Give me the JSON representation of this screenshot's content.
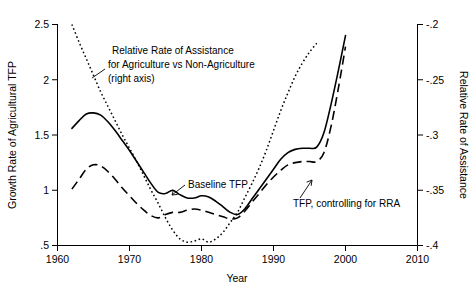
{
  "chart_data": {
    "type": "line",
    "title": "",
    "xlabel": "Year",
    "ylabel": "Growth Rate of Agricultural TFP",
    "y2label": "Relative Rate of Assistance",
    "xlim": [
      1960,
      2010
    ],
    "ylim": [
      0.5,
      2.5
    ],
    "y2lim": [
      -0.42,
      -0.18
    ],
    "grid": false,
    "legend_position": "inline-annotations",
    "xticks": [
      1960,
      1970,
      1980,
      1990,
      2000,
      2010
    ],
    "xticklabels": [
      "1960",
      "1970",
      "1980",
      "1990",
      "2000",
      "2010"
    ],
    "yticks": [
      0.5,
      1,
      1.5,
      2,
      2.5
    ],
    "yticklabels": [
      ".5",
      "1",
      "1.5",
      "2",
      "2.5"
    ],
    "y2ticks": [
      -0.4,
      -0.35,
      -0.3,
      -0.25,
      -0.2
    ],
    "y2ticklabels": [
      "-.4",
      "-.35",
      "-.3",
      "-.25",
      "-.2"
    ],
    "series": [
      {
        "name": "Baseline TFP",
        "axis": "left",
        "style": "solid",
        "x": [
          1962,
          1963,
          1964,
          1965,
          1966,
          1967,
          1968,
          1969,
          1970,
          1971,
          1972,
          1973,
          1974,
          1975,
          1976,
          1977,
          1978,
          1979,
          1980,
          1981,
          1982,
          1983,
          1984,
          1985,
          1986,
          1987,
          1988,
          1989,
          1990,
          1991,
          1992,
          1993,
          1994,
          1995,
          1996,
          1997,
          1998,
          1999,
          2000
        ],
        "values": [
          1.56,
          1.63,
          1.69,
          1.7,
          1.68,
          1.62,
          1.54,
          1.45,
          1.36,
          1.26,
          1.16,
          1.06,
          0.98,
          0.97,
          1.0,
          0.96,
          0.93,
          0.93,
          0.95,
          0.94,
          0.9,
          0.85,
          0.8,
          0.78,
          0.83,
          0.92,
          1.01,
          1.1,
          1.19,
          1.28,
          1.34,
          1.37,
          1.38,
          1.38,
          1.39,
          1.52,
          1.78,
          2.08,
          2.4
        ]
      },
      {
        "name": "TFP, controlling for RRA",
        "axis": "left",
        "style": "dashed",
        "x": [
          1962,
          1963,
          1964,
          1965,
          1966,
          1967,
          1968,
          1969,
          1970,
          1971,
          1972,
          1973,
          1974,
          1975,
          1976,
          1977,
          1978,
          1979,
          1980,
          1981,
          1982,
          1983,
          1984,
          1985,
          1986,
          1987,
          1988,
          1989,
          1990,
          1991,
          1992,
          1993,
          1994,
          1995,
          1996,
          1997,
          1998,
          1999,
          2000
        ],
        "values": [
          1.01,
          1.1,
          1.19,
          1.23,
          1.22,
          1.17,
          1.1,
          1.02,
          0.95,
          0.88,
          0.82,
          0.77,
          0.75,
          0.78,
          0.8,
          0.8,
          0.82,
          0.83,
          0.82,
          0.8,
          0.78,
          0.76,
          0.74,
          0.75,
          0.81,
          0.89,
          0.97,
          1.05,
          1.12,
          1.18,
          1.23,
          1.25,
          1.26,
          1.26,
          1.26,
          1.34,
          1.58,
          1.92,
          2.3
        ]
      },
      {
        "name": "Relative Rate of Assistance for Agriculture vs Non-Agriculture",
        "axis": "right",
        "style": "dotted",
        "x": [
          1962,
          1963,
          1964,
          1965,
          1966,
          1967,
          1968,
          1969,
          1970,
          1971,
          1972,
          1973,
          1974,
          1975,
          1976,
          1977,
          1978,
          1979,
          1980,
          1981,
          1982,
          1983,
          1984,
          1985,
          1986,
          1987,
          1988,
          1989,
          1990,
          1991,
          1992,
          1993,
          1994,
          1995,
          1996
        ],
        "values_left_scale": [
          2.5,
          2.34,
          2.19,
          2.04,
          1.89,
          1.76,
          1.63,
          1.5,
          1.38,
          1.26,
          1.13,
          1.0,
          0.88,
          0.75,
          0.64,
          0.56,
          0.53,
          0.54,
          0.56,
          0.53,
          0.56,
          0.62,
          0.71,
          0.8,
          0.93,
          1.06,
          1.2,
          1.36,
          1.54,
          1.72,
          1.88,
          2.03,
          2.15,
          2.25,
          2.33
        ]
      }
    ],
    "annotations": [
      {
        "id": "rra-annotation",
        "lines": [
          "Relative Rate of Assistance",
          "for Agriculture vs Non-Agriculture",
          "(right axis)"
        ]
      },
      {
        "id": "baseline-tfp-annotation",
        "lines": [
          "Baseline TFP"
        ]
      },
      {
        "id": "tfp-rra-annotation",
        "lines": [
          "TFP, controlling for RRA"
        ]
      }
    ]
  },
  "axes": {
    "x_title": "Year",
    "y_left_title": "Growth Rate of Agricultural TFP",
    "y_right_title": "Relative Rate of Assistance",
    "x_labels": [
      "1960",
      "1970",
      "1980",
      "1990",
      "2000",
      "2010"
    ],
    "y_left_labels": [
      "2.5",
      "2",
      "1.5",
      "1",
      ".5"
    ],
    "y_right_labels": [
      "-.2",
      "-.25",
      "-.3",
      "-.35",
      "-.4"
    ]
  },
  "annotations": {
    "rra_line1": "Relative Rate of Assistance",
    "rra_line2": "for Agriculture vs Non-Agriculture",
    "rra_line3": "(right axis)",
    "baseline": "Baseline TFP",
    "controlling": "TFP, controlling for RRA"
  },
  "colors": {
    "ink": "#000000",
    "background": "#ffffff"
  }
}
